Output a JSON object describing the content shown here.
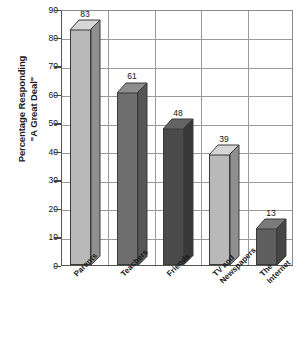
{
  "chart_data": {
    "type": "bar",
    "title": "",
    "subtitle": "",
    "xlabel": "",
    "ylabel": "Percentage Responding \"A Great Deal\"",
    "ylabel_lines": [
      "Percentage Responding",
      "\"A Great Deal\""
    ],
    "categories": [
      "Parents",
      "Teachers",
      "Friends",
      "TV and Newspapers",
      "The Internet"
    ],
    "category_lines": [
      [
        "Parents"
      ],
      [
        "Teachers"
      ],
      [
        "Friends"
      ],
      [
        "TV and",
        "Newspapers"
      ],
      [
        "The",
        "Internet"
      ]
    ],
    "values": [
      83,
      61,
      48,
      39,
      13
    ],
    "value_labels": [
      "83",
      "61",
      "48",
      "39",
      "13"
    ],
    "ylim": [
      0,
      90
    ],
    "ytick_step": 10,
    "yticks": [
      90,
      80,
      70,
      60,
      50,
      40,
      30,
      20,
      10,
      0
    ],
    "ytick_labels": [
      "90",
      "80",
      "70",
      "60",
      "50",
      "40",
      "30",
      "20",
      "10",
      "0"
    ],
    "grid": "horizontal-and-vertical",
    "legend": "none",
    "legend_position": "none",
    "bar_colors": [
      "#b9b9b9",
      "#6e6e6e",
      "#4a4a4a",
      "#b9b9b9",
      "#5e5e5e"
    ],
    "bar_top_colors": [
      "#d6d6d6",
      "#8d8d8d",
      "#636363",
      "#d6d6d6",
      "#7a7a7a"
    ],
    "bar_side_colors": [
      "#8f8f8f",
      "#565656",
      "#383838",
      "#8f8f8f",
      "#464646"
    ],
    "style": "3d-column",
    "axis_color": "#555555",
    "grid_color": "#9a9a9a",
    "background_color": "#ffffff"
  }
}
